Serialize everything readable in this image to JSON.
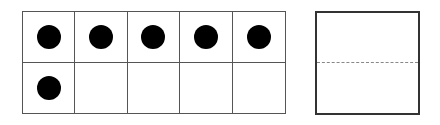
{
  "ten_frame": {
    "rows": 2,
    "columns": 5,
    "filled_count": 6,
    "cells": [
      true,
      true,
      true,
      true,
      true,
      true,
      false,
      false,
      false,
      false
    ],
    "counter_color": "#000000",
    "grid_color": "#555555"
  },
  "answer_box": {
    "value": "",
    "border_color": "#333333",
    "midline_style": "dashed",
    "midline_color": "#888888"
  }
}
